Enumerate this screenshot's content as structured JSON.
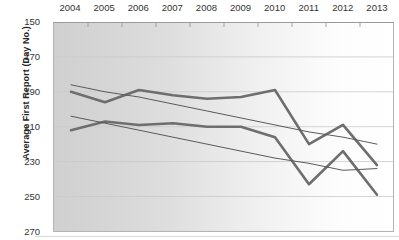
{
  "chart_data": {
    "type": "line",
    "title": "",
    "xlabel": "",
    "ylabel": "Average First Report (Day No.)",
    "categories": [
      "2004",
      "2005",
      "2006",
      "2007",
      "2008",
      "2009",
      "2010",
      "2011",
      "2012",
      "2013"
    ],
    "ylim": [
      150,
      270
    ],
    "y_inverted": true,
    "yticks": [
      150,
      170,
      190,
      210,
      230,
      250,
      270
    ],
    "grid": true,
    "legend": "none",
    "series": [
      {
        "name": "series-1-thick",
        "style": "thick",
        "color": "#6e6e6e",
        "values": [
          190,
          196,
          189,
          192,
          194,
          193,
          189,
          220,
          209,
          232
        ]
      },
      {
        "name": "series-2-thick",
        "style": "thick",
        "color": "#6e6e6e",
        "values": [
          212,
          207,
          209,
          208,
          210,
          210,
          216,
          243,
          224,
          249
        ]
      },
      {
        "name": "trend-1-thin",
        "style": "thin",
        "color": "#595959",
        "values": [
          186,
          190,
          193,
          197,
          201,
          205,
          209,
          213,
          216,
          220
        ]
      },
      {
        "name": "trend-2-thin",
        "style": "thin",
        "color": "#595959",
        "values": [
          204,
          208,
          212,
          216,
          220,
          224,
          228,
          231,
          235,
          234
        ]
      }
    ]
  },
  "axis": {
    "y_title": "Average First Report (Day No.)"
  }
}
